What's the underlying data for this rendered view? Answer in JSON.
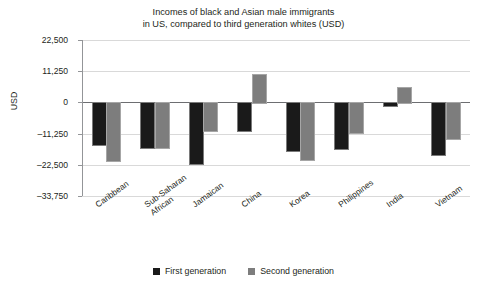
{
  "chart_data": {
    "type": "bar",
    "title": "Incomes of black and Asian male immigrants in US, compared to third generation whites  (USD)",
    "title_lines": [
      "Incomes of black and Asian male immigrants",
      "in US, compared to third generation whites  (USD)"
    ],
    "xlabel": "",
    "ylabel": "USD",
    "ylim": [
      -33750,
      22500
    ],
    "yticks": [
      22500,
      11250,
      0,
      -11250,
      -22500,
      -33750
    ],
    "ytick_labels": [
      "22,500",
      "11,250",
      "0",
      "–11,250",
      "–22,500",
      "–33,750"
    ],
    "grid": true,
    "legend_position": "bottom",
    "categories": [
      "Caribbean",
      "Sub-Saharan African",
      "Jamaican",
      "China",
      "Korea",
      "Philippines",
      "India",
      "Vietnam"
    ],
    "category_lines": [
      [
        "Caribbean"
      ],
      [
        "Sub-Saharan",
        "African"
      ],
      [
        "Jamaican"
      ],
      [
        "China"
      ],
      [
        "Korea"
      ],
      [
        "Philippines"
      ],
      [
        "India"
      ],
      [
        "Vietnam"
      ]
    ],
    "series": [
      {
        "name": "First generation",
        "color": "#1a1a1a",
        "values": [
          -14900,
          -16000,
          -21800,
          -9800,
          -17000,
          -16600,
          -1000,
          -18500
        ]
      },
      {
        "name": "Second generation",
        "color": "#7d7d7d",
        "values": [
          -20700,
          -16000,
          -9800,
          10200,
          -20300,
          -10500,
          5500,
          -12700
        ]
      }
    ]
  },
  "legend": {
    "items": [
      {
        "label": "First generation"
      },
      {
        "label": "Second generation"
      }
    ]
  }
}
